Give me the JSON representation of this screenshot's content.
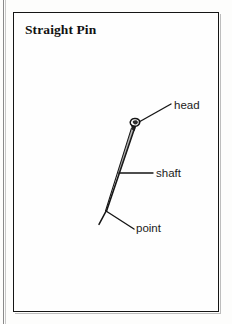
{
  "figure": {
    "title": "Straight Pin",
    "subject": "straight pin",
    "style": "black-and-white line drawing"
  },
  "labels": {
    "head": "head",
    "shaft": "shaft",
    "point": "point"
  },
  "colors": {
    "ink": "#151515",
    "paper": "#fdfdfc",
    "edge_rule": "#8a8a8a"
  },
  "geometry": {
    "frame": {
      "x": 13,
      "y": 12,
      "width": 206,
      "height": 300
    },
    "pin": {
      "head_center": {
        "x": 136,
        "y": 124
      },
      "shaft_top": {
        "x": 134,
        "y": 128
      },
      "shaft_bottom": {
        "x": 106,
        "y": 211
      }
    },
    "leaders": {
      "head": {
        "x1": 139,
        "y1": 122,
        "x2": 171,
        "y2": 104
      },
      "shaft": {
        "x1": 120,
        "y1": 173,
        "x2": 153,
        "y2": 173
      },
      "point": {
        "x1": 106,
        "y1": 211,
        "x2": 134,
        "y2": 229
      }
    }
  }
}
